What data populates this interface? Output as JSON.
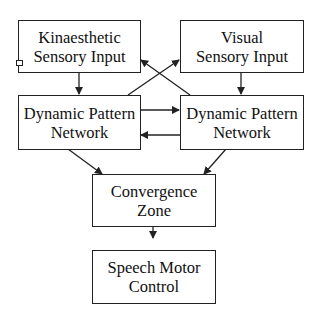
{
  "diagram": {
    "nodes": [
      {
        "id": "kinaesthetic",
        "lines": [
          "Kinaesthetic",
          "Sensory Input"
        ]
      },
      {
        "id": "visual",
        "lines": [
          "Visual",
          "Sensory Input"
        ]
      },
      {
        "id": "dpn_left",
        "lines": [
          "Dynamic Pattern",
          "Network"
        ]
      },
      {
        "id": "dpn_right",
        "lines": [
          "Dynamic Pattern",
          "Network"
        ]
      },
      {
        "id": "convergence",
        "lines": [
          "Convergence",
          "Zone"
        ]
      },
      {
        "id": "speech_motor",
        "lines": [
          "Speech Motor",
          "Control"
        ]
      }
    ],
    "edges": [
      {
        "from": "kinaesthetic",
        "to": "dpn_left"
      },
      {
        "from": "visual",
        "to": "dpn_right"
      },
      {
        "from": "dpn_left",
        "to": "visual"
      },
      {
        "from": "dpn_right",
        "to": "kinaesthetic"
      },
      {
        "from": "dpn_left",
        "to": "dpn_right"
      },
      {
        "from": "dpn_right",
        "to": "dpn_left"
      },
      {
        "from": "dpn_left",
        "to": "convergence"
      },
      {
        "from": "dpn_right",
        "to": "convergence"
      },
      {
        "from": "convergence",
        "to": "speech_motor"
      }
    ],
    "colors": {
      "stroke": "#222222",
      "background": "#ffffff"
    }
  }
}
